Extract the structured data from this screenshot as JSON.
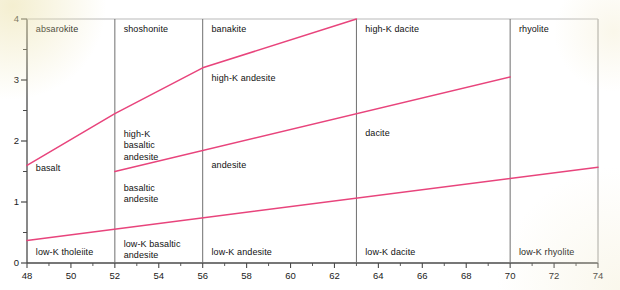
{
  "chart_data": {
    "type": "line",
    "title": "",
    "xlabel": "",
    "ylabel": "",
    "xlim": [
      48,
      74
    ],
    "ylim": [
      0,
      4
    ],
    "grid": false,
    "legend": "none",
    "x_ticks": [
      48,
      50,
      52,
      54,
      56,
      58,
      60,
      62,
      64,
      66,
      68,
      70,
      72,
      74
    ],
    "x_tick_labels": [
      "48",
      "50",
      "52",
      "54",
      "56",
      "58",
      "60",
      "62",
      "64",
      "66",
      "68",
      "70",
      "72",
      "74"
    ],
    "x_minor_ticks": [
      49,
      51,
      53,
      55,
      57,
      59,
      61,
      63,
      65,
      67,
      69,
      71,
      73
    ],
    "y_ticks": [
      0,
      1,
      2,
      3,
      4
    ],
    "y_tick_labels": [
      "0",
      "1",
      "2",
      "3",
      "4"
    ],
    "y_minor_ticks": [
      0.5,
      1.5,
      2.5,
      3.5
    ],
    "line_color": "#e8447c",
    "divider_color": "#6f6f6f",
    "axis_color": "#4a4a4a",
    "series": [
      {
        "name": "high-K / shoshonitic boundary",
        "points": [
          [
            48,
            1.6
          ],
          [
            52,
            2.45
          ],
          [
            56,
            3.2
          ],
          [
            63,
            4.0
          ]
        ]
      },
      {
        "name": "medium-K / high-K boundary",
        "points": [
          [
            52,
            1.5
          ],
          [
            70,
            3.05
          ]
        ]
      },
      {
        "name": "low-K / medium-K boundary",
        "points": [
          [
            48,
            0.37
          ],
          [
            74,
            1.57
          ]
        ]
      }
    ],
    "vertical_dividers": [
      52,
      56,
      63,
      70
    ],
    "field_labels": [
      {
        "text": "absarokite",
        "x": 48.4,
        "y": 3.8
      },
      {
        "text": "shoshonite",
        "x": 52.4,
        "y": 3.8
      },
      {
        "text": "banakite",
        "x": 56.4,
        "y": 3.8
      },
      {
        "text": "high-K dacite",
        "x": 63.4,
        "y": 3.8
      },
      {
        "text": "rhyolite",
        "x": 70.4,
        "y": 3.8
      },
      {
        "text": "high-K andesite",
        "x": 56.4,
        "y": 3.0
      },
      {
        "text": "dacite",
        "x": 63.4,
        "y": 2.1
      },
      {
        "text": "high-K\nbasaltic\nandesite",
        "x": 52.4,
        "y": 2.08
      },
      {
        "text": "basalt",
        "x": 48.4,
        "y": 1.53
      },
      {
        "text": "andesite",
        "x": 56.4,
        "y": 1.57
      },
      {
        "text": "basaltic\nandesite",
        "x": 52.4,
        "y": 1.2
      },
      {
        "text": "low-K tholeiite",
        "x": 48.4,
        "y": 0.14
      },
      {
        "text": "low-K basaltic\nandesite",
        "x": 52.4,
        "y": 0.28
      },
      {
        "text": "low-K andesite",
        "x": 56.4,
        "y": 0.14
      },
      {
        "text": "low-K dacite",
        "x": 63.4,
        "y": 0.14
      },
      {
        "text": "low-K rhyolite",
        "x": 70.4,
        "y": 0.14
      }
    ]
  }
}
